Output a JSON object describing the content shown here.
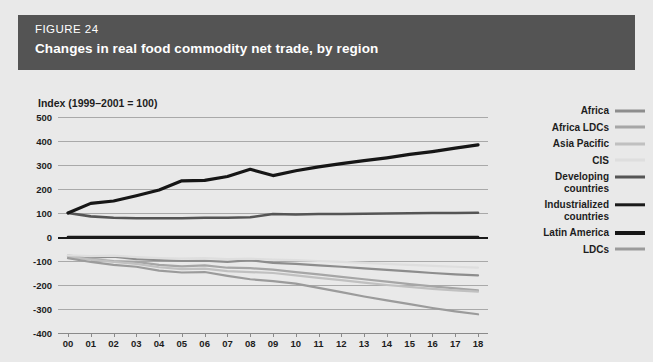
{
  "header": {
    "figure_number": "FIGURE 24",
    "title": "Changes in real food commodity net trade, by region",
    "banner_color": "#545454",
    "text_color": "#ffffff"
  },
  "page": {
    "background_color": "#e9e9e9",
    "panel_color": "#e9e9e9"
  },
  "chart_data": {
    "type": "line",
    "title": "Changes in real food commodity net trade, by region",
    "subtitle": "FIGURE 24",
    "ylabel": "Index (1999–2001 = 100)",
    "xlabel": "",
    "axis_note": "Index (1999–2001 = 100)",
    "grid": true,
    "legend_position": "right",
    "ylim": [
      -400,
      500
    ],
    "yticks": [
      500,
      400,
      300,
      200,
      100,
      0,
      -100,
      -200,
      -300,
      -400
    ],
    "ytick_labels": [
      "500",
      "400",
      "300",
      "200",
      "100",
      "0",
      "-100",
      "-200",
      "-300",
      "-400"
    ],
    "x": [
      "00",
      "01",
      "02",
      "03",
      "04",
      "05",
      "06",
      "07",
      "08",
      "09",
      "10",
      "11",
      "12",
      "13",
      "14",
      "15",
      "16",
      "17",
      "18"
    ],
    "xtick_labels": [
      "00",
      "01",
      "02",
      "03",
      "04",
      "05",
      "06",
      "07",
      "08",
      "09",
      "10",
      "11",
      "12",
      "13",
      "14",
      "15",
      "16",
      "17",
      "18"
    ],
    "series": [
      {
        "name": "Africa",
        "color": "#8d8d8d",
        "width": 2.2,
        "values": [
          -78,
          -86,
          -82,
          -92,
          -96,
          -100,
          -99,
          -104,
          -96,
          -108,
          -112,
          -118,
          -124,
          -131,
          -137,
          -143,
          -150,
          -156,
          -160
        ]
      },
      {
        "name": "Africa LDCs",
        "color": "#a6a6a6",
        "width": 2.2,
        "values": [
          -80,
          -92,
          -100,
          -104,
          -116,
          -122,
          -118,
          -128,
          -130,
          -136,
          -146,
          -156,
          -166,
          -176,
          -186,
          -196,
          -206,
          -214,
          -222
        ]
      },
      {
        "name": "Asia Pacific",
        "color": "#c0c0c0",
        "width": 2.2,
        "values": [
          -82,
          -94,
          -104,
          -112,
          -126,
          -134,
          -132,
          -142,
          -146,
          -150,
          -160,
          -170,
          -180,
          -190,
          -200,
          -208,
          -216,
          -222,
          -228
        ]
      },
      {
        "name": "CIS",
        "color": "#dedede",
        "width": 2.2,
        "values": [
          -76,
          -80,
          -78,
          -84,
          -88,
          -90,
          -88,
          -92,
          -90,
          -94,
          -96,
          -100,
          -104,
          -108,
          -112,
          -116,
          -120,
          -124,
          -128
        ]
      },
      {
        "name": "Developing countries",
        "color": "#555555",
        "width": 2.6,
        "values": [
          100,
          86,
          80,
          78,
          78,
          78,
          80,
          80,
          82,
          96,
          94,
          96,
          96,
          97,
          98,
          99,
          100,
          100,
          101
        ]
      },
      {
        "name": "Industrialized countries",
        "color": "#1a1a1a",
        "width": 2.6,
        "values": [
          0,
          0,
          0,
          0,
          0,
          0,
          0,
          0,
          0,
          0,
          0,
          0,
          0,
          0,
          0,
          0,
          0,
          0,
          0
        ]
      },
      {
        "name": "Latin America",
        "color": "#161616",
        "width": 3.2,
        "values": [
          100,
          140,
          150,
          172,
          196,
          234,
          236,
          252,
          282,
          256,
          276,
          292,
          306,
          318,
          330,
          344,
          356,
          370,
          384
        ]
      },
      {
        "name": "LDCs",
        "color": "#9b9b9b",
        "width": 2.2,
        "values": [
          -88,
          -104,
          -116,
          -124,
          -140,
          -148,
          -146,
          -162,
          -176,
          -184,
          -194,
          -212,
          -230,
          -248,
          -264,
          -280,
          -296,
          -310,
          -322
        ]
      }
    ]
  },
  "legend": {
    "items": [
      {
        "label": "Africa",
        "color": "#8d8d8d",
        "thickness": 3
      },
      {
        "label": "Africa LDCs",
        "color": "#a6a6a6",
        "thickness": 3
      },
      {
        "label": "Asia Pacific",
        "color": "#c0c0c0",
        "thickness": 3
      },
      {
        "label": "CIS",
        "color": "#dedede",
        "thickness": 3
      },
      {
        "label": "Developing\ncountries",
        "color": "#555555",
        "thickness": 3
      },
      {
        "label": "Industrialized\ncountries",
        "color": "#1a1a1a",
        "thickness": 3.4
      },
      {
        "label": "Latin America",
        "color": "#161616",
        "thickness": 4
      },
      {
        "label": "LDCs",
        "color": "#9b9b9b",
        "thickness": 3
      }
    ]
  }
}
